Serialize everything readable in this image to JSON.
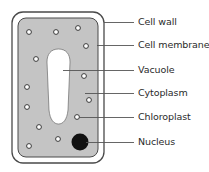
{
  "colors": {
    "cytoplasm": "#c4c4c4",
    "outline": "#4a4a4a",
    "vacuole": "#ffffff",
    "nucleus": "#111111",
    "leader_line": "#555555",
    "label_text": "#2a2a2a"
  },
  "cell": {
    "wall": {
      "x": 12,
      "y": 12,
      "w": 92,
      "h": 151,
      "rx": 11
    },
    "membrane": {
      "x": 18,
      "y": 18,
      "w": 80,
      "h": 139,
      "rx": 8
    },
    "vacuole_path": "M58.5,49 C66,49 70,54 70,62 L68,110 C67,120 63,124 58.5,124 C54,124 50,120 49,110 L47,62 C47,54 51,49 58.5,49 Z",
    "nucleus": {
      "cx": 80,
      "cy": 142,
      "r": 8.5
    },
    "chloroplasts": [
      {
        "cx": 29,
        "cy": 32
      },
      {
        "cx": 56,
        "cy": 32
      },
      {
        "cx": 78,
        "cy": 28
      },
      {
        "cx": 86,
        "cy": 46
      },
      {
        "cx": 36,
        "cy": 59
      },
      {
        "cx": 84,
        "cy": 76
      },
      {
        "cx": 27,
        "cy": 87
      },
      {
        "cx": 89,
        "cy": 100
      },
      {
        "cx": 27,
        "cy": 107
      },
      {
        "cx": 77,
        "cy": 117
      },
      {
        "cx": 39,
        "cy": 127
      },
      {
        "cx": 58,
        "cy": 139
      },
      {
        "cx": 29,
        "cy": 146
      }
    ]
  },
  "labels": [
    {
      "id": "cell-wall",
      "text": "Cell wall",
      "y": 22,
      "line_x1": 104
    },
    {
      "id": "cell-membrane",
      "text": "Cell membrane",
      "y": 45,
      "line_x1": 97
    },
    {
      "id": "vacuole",
      "text": "Vacuole",
      "y": 70,
      "line_x1": 63
    },
    {
      "id": "cytoplasm",
      "text": "Cytoplasm",
      "y": 93,
      "line_x1": 85
    },
    {
      "id": "chloroplast",
      "text": "Chloroplast",
      "y": 117,
      "line_x1": 79
    },
    {
      "id": "nucleus",
      "text": "Nucleus",
      "y": 142,
      "line_x1": 86
    }
  ],
  "line_x2": 134
}
